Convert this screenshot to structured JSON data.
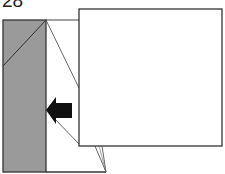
{
  "diagram": {
    "step_number": "28",
    "colors": {
      "shaded_panel": "#9a9a9a",
      "line": "#333333",
      "arrow": "#111111",
      "paper": "#ffffff"
    },
    "elements": {
      "shaded_panel": "gray back side of paper on left",
      "front_square": "white square layer on right",
      "arrow": "black arrow pointing left"
    }
  }
}
